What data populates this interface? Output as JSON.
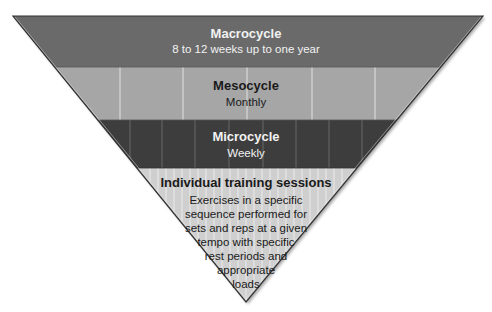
{
  "diagram": {
    "type": "inverted-pyramid",
    "colors": {
      "macrocycle": "#6a6a6a",
      "mesocycle": "#a6a6a6",
      "microcycle": "#3d3d3d",
      "sessions": "#cfcfcf",
      "stripe": "#ffffff",
      "outline": "#333333"
    },
    "levels": [
      {
        "title": "Macrocycle",
        "subtitle": "8 to 12 weeks up to one year"
      },
      {
        "title": "Mesocycle",
        "subtitle": "Monthly"
      },
      {
        "title": "Microcycle",
        "subtitle": "Weekly"
      },
      {
        "title": "Individual training sessions",
        "description_lines": [
          "Exercises in a specific",
          "sequence performed for",
          "sets and reps at a given",
          "tempo with specific",
          "rest periods and",
          "appropriate",
          "loads"
        ]
      }
    ]
  }
}
